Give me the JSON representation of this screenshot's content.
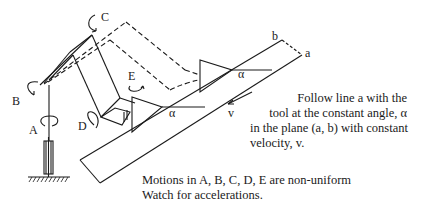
{
  "diagram": {
    "joint_labels": {
      "A": "A",
      "B": "B",
      "C": "C",
      "D": "D",
      "E": "E"
    },
    "line_labels": {
      "a": "a",
      "b": "b"
    },
    "angle_label": "α",
    "velocity_label": "v",
    "instructions": [
      "Follow line a with the",
      "tool at the constant angle, α",
      "in the plane (a, b) with constant",
      "velocity, v."
    ],
    "note": [
      "Motions in A, B, C, D, E are non-uniform",
      "Watch for accelerations."
    ]
  }
}
